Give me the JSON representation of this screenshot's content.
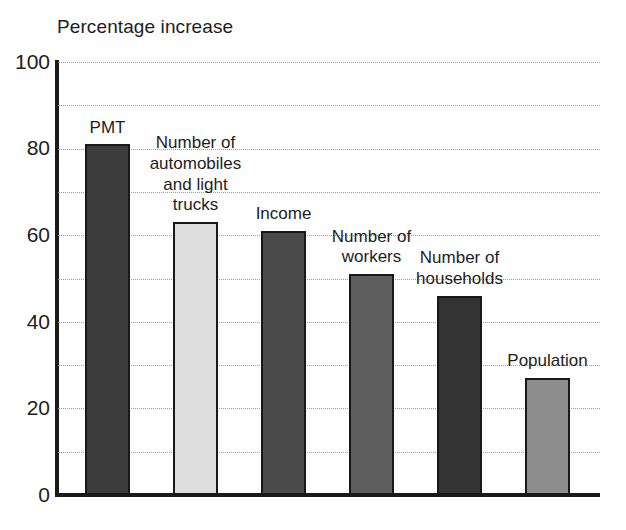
{
  "chart_data": {
    "type": "bar",
    "title": "Percentage increase",
    "xlabel": "",
    "ylabel": "",
    "ylim": [
      0,
      100
    ],
    "yticks": [
      0,
      20,
      40,
      60,
      80,
      100
    ],
    "ytick_labels": [
      "0",
      "20",
      "40",
      "60",
      "80",
      "100"
    ],
    "gridlines": [
      10,
      20,
      30,
      40,
      50,
      60,
      70,
      80,
      90,
      100
    ],
    "grid": true,
    "grid_style": "dotted",
    "legend": "none",
    "categories": [
      "PMT",
      "Number of automobiles and light trucks",
      "Income",
      "Number of workers",
      "Number of households",
      "Population"
    ],
    "values": [
      81,
      63,
      61,
      51,
      46,
      27
    ],
    "bar_colors": [
      "#3c3c3c",
      "#dedede",
      "#4b4b4b",
      "#5e5e5e",
      "#333333",
      "#8d8d8d"
    ],
    "bar_labels": [
      "PMT",
      "Number of\nautomobiles\nand light\ntrucks",
      "Income",
      "Number of\nworkers",
      "Number of\nhouseholds",
      "Population"
    ]
  },
  "axis": {
    "tick_0": "0",
    "tick_20": "20",
    "tick_40": "40",
    "tick_60": "60",
    "tick_80": "80",
    "tick_100": "100"
  }
}
